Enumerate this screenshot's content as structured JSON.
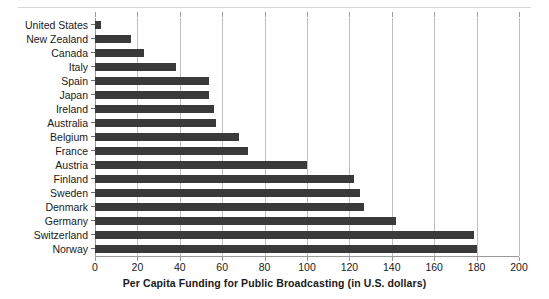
{
  "chart_data": {
    "type": "bar",
    "orientation": "horizontal",
    "title": "",
    "xlabel": "Per Capita Funding for Public Broadcasting (in U.S. dollars)",
    "ylabel": "",
    "xlim": [
      0,
      200
    ],
    "xticks": [
      0,
      20,
      40,
      60,
      80,
      100,
      120,
      140,
      160,
      180,
      200
    ],
    "grid": true,
    "legend": false,
    "bar_color": "#3a3a3a",
    "gridline_color": "#bfbfbf",
    "categories": [
      "United States",
      "New Zealand",
      "Canada",
      "Italy",
      "Spain",
      "Japan",
      "Ireland",
      "Australia",
      "Belgium",
      "France",
      "Austria",
      "Finland",
      "Sweden",
      "Denmark",
      "Germany",
      "Switzerland",
      "Norway"
    ],
    "values": [
      3,
      17,
      23,
      38,
      54,
      54,
      56,
      57,
      68,
      72,
      100,
      122,
      125,
      127,
      142,
      179,
      180
    ]
  }
}
